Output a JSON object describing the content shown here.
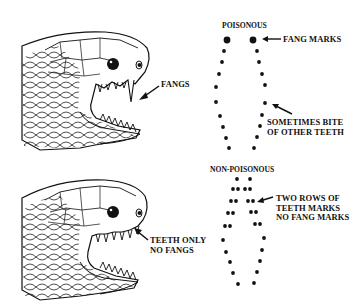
{
  "figure": {
    "panels": [
      {
        "id": "poisonous-snake-head",
        "label_lines": [
          "FANGS"
        ]
      },
      {
        "id": "non-poisonous-snake-head",
        "label_lines": [
          "TEETH ONLY",
          "NO FANGS"
        ]
      }
    ],
    "bite_patterns": {
      "poisonous": {
        "title": "POISONOUS",
        "annotations": [
          {
            "lines": [
              "FANG MARKS"
            ]
          },
          {
            "lines": [
              "SOMETIMES BITE",
              "OF OTHER TEETH"
            ]
          }
        ]
      },
      "non_poisonous": {
        "title": "NON-POISONOUS",
        "annotations": [
          {
            "lines": [
              "TWO ROWS OF",
              "TEETH MARKS",
              "NO FANG MARKS"
            ]
          }
        ]
      }
    },
    "colors": {
      "ink": "#111111",
      "background": "#ffffff"
    }
  }
}
